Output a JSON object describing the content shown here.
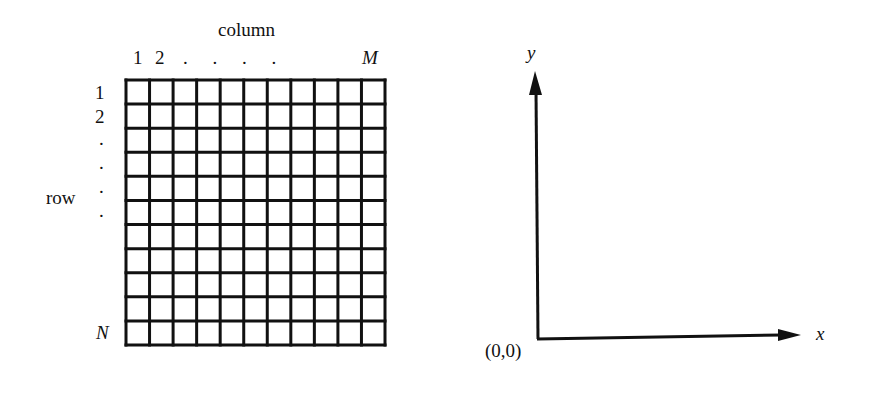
{
  "pixel_grid": {
    "column_title": "column",
    "column_labels": {
      "first": "1",
      "second": "2",
      "ellipsis": ". . . .",
      "last": "M"
    },
    "row_title": "row",
    "row_labels": {
      "first": "1",
      "second": "2",
      "dots": [
        ".",
        ".",
        ".",
        "."
      ],
      "last": "N"
    },
    "columns": 11,
    "rows": 11,
    "line_color": "#111111"
  },
  "coordinate_axes": {
    "y_label": "y",
    "x_label": "x",
    "origin_label": "(0,0)",
    "line_color": "#111111"
  }
}
